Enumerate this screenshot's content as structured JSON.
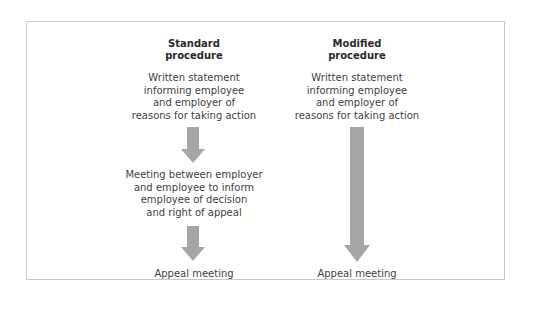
{
  "diagram": {
    "colors": {
      "arrow": "#a6a6a6",
      "border": "#c8c8c8",
      "text": "#3f3f3f"
    },
    "columns": [
      {
        "heading_line1": "Standard",
        "heading_line2": "procedure",
        "steps": [
          "Written statement\ninforming employee\nand employer of\nreasons for taking action",
          "Meeting between employer\nand employee to inform\nemployee of decision\nand right of appeal",
          "Appeal meeting"
        ]
      },
      {
        "heading_line1": "Modified",
        "heading_line2": "procedure",
        "steps": [
          "Written statement\ninforming employee\nand employer of\nreasons for taking action",
          "Appeal meeting"
        ]
      }
    ]
  }
}
